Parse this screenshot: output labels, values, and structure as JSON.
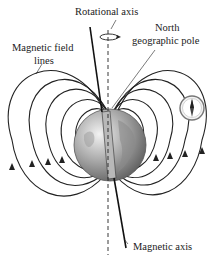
{
  "labels": {
    "rotational_axis": "Rotational axis",
    "north_pole_line1": "North",
    "north_pole_line2": "geographic pole",
    "field_lines_line1": "Magnetic field",
    "field_lines_line2": "lines",
    "magnetic_axis": "Magnetic axis"
  },
  "colors": {
    "line": "#222222",
    "earth_light": "#dcdcdc",
    "earth_dark": "#6e6e6e",
    "magnet": "#b8b8b8"
  },
  "icons": {
    "compass": "compass-icon",
    "rotation_arrow": "rotation-arrow-icon",
    "bar_magnet": "bar-magnet-icon"
  }
}
